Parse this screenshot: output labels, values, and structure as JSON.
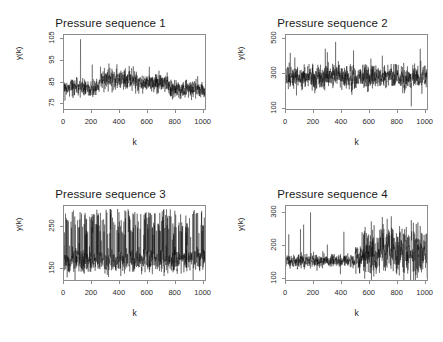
{
  "figure": {
    "background": "#ffffff",
    "trace_color": "#000000",
    "axis_color": "#8c8c8c",
    "text_color": "#1a1a1a",
    "layout": "2x2"
  },
  "panels": [
    {
      "title": "Pressure sequence 1",
      "xlabel": "k",
      "ylabel": "y(k)",
      "xticks": [
        "0",
        "200",
        "400",
        "600",
        "800",
        "1000"
      ],
      "yticks": [
        "75",
        "85",
        "95",
        "105"
      ]
    },
    {
      "title": "Pressure sequence 2",
      "xlabel": "k",
      "ylabel": "y(k)",
      "xticks": [
        "0",
        "200",
        "400",
        "600",
        "800",
        "1000"
      ],
      "yticks": [
        "100",
        "300",
        "500"
      ]
    },
    {
      "title": "Pressure sequence 3",
      "xlabel": "k",
      "ylabel": "y(k)",
      "xticks": [
        "0",
        "200",
        "400",
        "600",
        "800",
        "1000"
      ],
      "yticks": [
        "150",
        "250"
      ]
    },
    {
      "title": "Pressure sequence 4",
      "xlabel": "k",
      "ylabel": "y(k)",
      "xticks": [
        "0",
        "200",
        "400",
        "600",
        "800",
        "1000"
      ],
      "yticks": [
        "100",
        "200",
        "300"
      ]
    }
  ],
  "chart_data": [
    {
      "type": "line",
      "title": "Pressure sequence 1",
      "xlabel": "k",
      "ylabel": "y(k)",
      "xlim": [
        0,
        1024
      ],
      "ylim": [
        72,
        107
      ],
      "xticks": [
        0,
        200,
        400,
        600,
        800,
        1000
      ],
      "yticks": [
        75,
        85,
        95,
        105
      ],
      "grid": false,
      "legend": null,
      "n_points": 1024,
      "description": "Dense noisy pressure time series, baseline ~82 rising to ~86 mid-record then declining to ~81; single large spike to ~105 near k=120",
      "series": [
        {
          "name": "y(k)",
          "baseline": 83,
          "noise_sd": 2.2,
          "segments": [
            {
              "k_start": 0,
              "k_end": 260,
              "mean": 82.0,
              "sd": 2.0
            },
            {
              "k_start": 260,
              "k_end": 520,
              "mean": 86.0,
              "sd": 2.4
            },
            {
              "k_start": 520,
              "k_end": 760,
              "mean": 84.5,
              "sd": 2.3
            },
            {
              "k_start": 760,
              "k_end": 1024,
              "mean": 81.5,
              "sd": 2.1
            }
          ],
          "spikes": [
            {
              "k": 120,
              "value": 105
            },
            {
              "k": 205,
              "value": 93
            },
            {
              "k": 265,
              "value": 92
            },
            {
              "k": 620,
              "value": 92
            }
          ]
        }
      ]
    },
    {
      "type": "line",
      "title": "Pressure sequence 2",
      "xlabel": "k",
      "ylabel": "y(k)",
      "xlim": [
        0,
        1024
      ],
      "ylim": [
        90,
        520
      ],
      "xticks": [
        0,
        200,
        400,
        600,
        800,
        1000
      ],
      "yticks": [
        100,
        300,
        500
      ],
      "grid": false,
      "legend": null,
      "n_points": 1024,
      "description": "Noisy series with mean near 275, frequent upward spikes to 400-480 and one deep downward spike to ~105 near k=910",
      "series": [
        {
          "name": "y(k)",
          "baseline": 275,
          "noise_sd": 35,
          "segments": [
            {
              "k_start": 0,
              "k_end": 1024,
              "mean": 275,
              "sd": 35
            }
          ],
          "spikes": [
            {
              "k": 285,
              "value": 440
            },
            {
              "k": 300,
              "value": 420
            },
            {
              "k": 360,
              "value": 480
            },
            {
              "k": 490,
              "value": 430
            },
            {
              "k": 700,
              "value": 400
            },
            {
              "k": 910,
              "value": 105
            },
            {
              "k": 975,
              "value": 440
            }
          ]
        }
      ]
    },
    {
      "type": "line",
      "title": "Pressure sequence 3",
      "xlabel": "k",
      "ylabel": "y(k)",
      "xlim": [
        0,
        1024
      ],
      "ylim": [
        120,
        300
      ],
      "xticks": [
        0,
        200,
        400,
        600,
        800,
        1000
      ],
      "yticks": [
        150,
        250
      ],
      "grid": false,
      "legend": null,
      "n_points": 1024,
      "description": "Highly spiky series with low baseline near 165 and very frequent tall excursions reaching 250-290 throughout the record",
      "series": [
        {
          "name": "y(k)",
          "baseline": 165,
          "noise_sd": 14,
          "burst_rate": 0.22,
          "burst_amplitude": [
            60,
            125
          ],
          "segments": [
            {
              "k_start": 0,
              "k_end": 1024,
              "mean": 168,
              "sd": 16
            }
          ],
          "spikes": [
            {
              "k": 60,
              "value": 285
            },
            {
              "k": 210,
              "value": 275
            },
            {
              "k": 500,
              "value": 282
            },
            {
              "k": 745,
              "value": 292
            },
            {
              "k": 1000,
              "value": 288
            }
          ]
        }
      ]
    },
    {
      "type": "line",
      "title": "Pressure sequence 4",
      "xlabel": "k",
      "ylabel": "y(k)",
      "xlim": [
        0,
        1024
      ],
      "ylim": [
        90,
        320
      ],
      "xticks": [
        0,
        200,
        400,
        600,
        800,
        1000
      ],
      "yticks": [
        100,
        200,
        300
      ],
      "grid": false,
      "legend": null,
      "n_points": 1024,
      "description": "Quiet low-variance baseline near 150 for k<500 with isolated spikes, then a regime change after k=550 with much larger variance and frequent peaks to 250-290",
      "series": [
        {
          "name": "y(k)",
          "baseline": 150,
          "segments": [
            {
              "k_start": 0,
              "k_end": 500,
              "mean": 150,
              "sd": 10
            },
            {
              "k_start": 500,
              "k_end": 560,
              "mean": 165,
              "sd": 25
            },
            {
              "k_start": 560,
              "k_end": 1024,
              "mean": 180,
              "sd": 38
            }
          ],
          "spikes": [
            {
              "k": 20,
              "value": 232
            },
            {
              "k": 105,
              "value": 248
            },
            {
              "k": 128,
              "value": 262
            },
            {
              "k": 178,
              "value": 300
            },
            {
              "k": 300,
              "value": 200
            },
            {
              "k": 395,
              "value": 108
            },
            {
              "k": 420,
              "value": 240
            },
            {
              "k": 620,
              "value": 272
            },
            {
              "k": 700,
              "value": 286
            },
            {
              "k": 735,
              "value": 280
            },
            {
              "k": 765,
              "value": 288
            },
            {
              "k": 860,
              "value": 112
            },
            {
              "k": 925,
              "value": 268
            },
            {
              "k": 975,
              "value": 258
            }
          ]
        }
      ]
    }
  ]
}
